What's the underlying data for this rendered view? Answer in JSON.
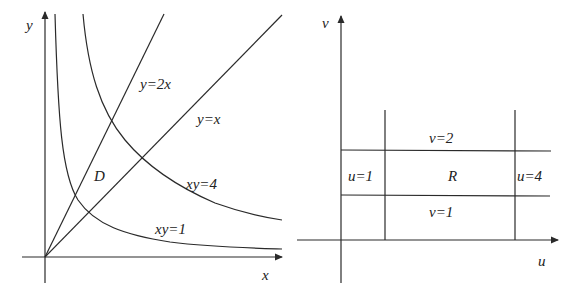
{
  "left_panel": {
    "x_axis_label": "x",
    "y_axis_label": "y",
    "region_label": "D",
    "curves": [
      {
        "name": "line-y-2x",
        "label": "y=2x",
        "equation": "y = 2x"
      },
      {
        "name": "line-y-x",
        "label": "y=x",
        "equation": "y = x"
      },
      {
        "name": "hyperbola-xy-4",
        "label": "xy=4",
        "equation": "xy = 4"
      },
      {
        "name": "hyperbola-xy-1",
        "label": "xy=1",
        "equation": "xy = 1"
      }
    ]
  },
  "right_panel": {
    "x_axis_label": "u",
    "y_axis_label": "v",
    "region_label": "R",
    "lines": [
      {
        "name": "line-u-1",
        "label": "u=1"
      },
      {
        "name": "line-u-4",
        "label": "u=4"
      },
      {
        "name": "line-v-2",
        "label": "v=2"
      },
      {
        "name": "line-v-1",
        "label": "v=1"
      }
    ]
  },
  "colors": {
    "stroke": "#2a2a2a",
    "background": "#ffffff"
  }
}
